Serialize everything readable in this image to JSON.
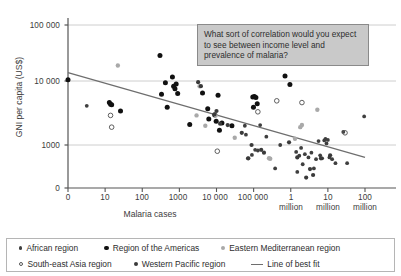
{
  "chart_data": {
    "type": "scatter",
    "title": "",
    "xlabel": "Malaria cases",
    "ylabel": "GNI per capita (US$)",
    "x_ticks": [
      "0",
      "10",
      "100",
      "1000",
      "10 000",
      "100 000",
      "1\nmillion",
      "10\nmillion",
      "100\nmillion"
    ],
    "x_tick_labels": [
      "0",
      "10",
      "100",
      "1000",
      "10 000",
      "100 000",
      "1",
      "10",
      "100"
    ],
    "x_tick_sublabels": [
      "",
      "",
      "",
      "",
      "",
      "",
      "million",
      "million",
      "million"
    ],
    "y_ticks": [
      "0",
      "1000",
      "10 000",
      "100 000"
    ],
    "x_scale": "log",
    "y_scale": "log",
    "grid": "horizontal",
    "legend_position": "below",
    "xlim": [
      0,
      100000000
    ],
    "ylim": [
      0,
      100000
    ],
    "series": [
      {
        "name": "African region",
        "marker": "small-filled-dark-dot",
        "color": "#3f3f3f",
        "points": [
          [
            3.2,
            4100
          ],
          [
            220000,
            1350
          ],
          [
            380000,
            430
          ],
          [
            520000,
            1000
          ],
          [
            1400000,
            780
          ],
          [
            1500000,
            380
          ],
          [
            1700000,
            680
          ],
          [
            1900000,
            900
          ],
          [
            2100000,
            500
          ],
          [
            2400000,
            720
          ],
          [
            3000000,
            640
          ],
          [
            3600000,
            760
          ],
          [
            4200000,
            430
          ],
          [
            4800000,
            600
          ],
          [
            5600000,
            1150
          ],
          [
            6200000,
            690
          ],
          [
            7000000,
            620
          ],
          [
            8000000,
            1180
          ],
          [
            8600000,
            1240
          ],
          [
            9200000,
            1060
          ],
          [
            10000000,
            1200
          ],
          [
            11000000,
            640
          ],
          [
            13000000,
            600
          ],
          [
            16000000,
            520
          ],
          [
            26000000,
            1600
          ],
          [
            33000000,
            520
          ],
          [
            95000000,
            2800
          ],
          [
            150000,
            2050
          ],
          [
            90000,
            700
          ],
          [
            110000,
            840
          ],
          [
            130000,
            820
          ],
          [
            62000,
            1450
          ],
          [
            70000,
            620
          ],
          [
            58000,
            2000
          ]
        ]
      },
      {
        "name": "Region of the Americas",
        "marker": "medium-filled-black-dot",
        "color": "#111111",
        "points": [
          [
            0.9,
            10500
          ],
          [
            13,
            4600
          ],
          [
            14,
            4350
          ],
          [
            15,
            4250
          ],
          [
            26,
            3400
          ],
          [
            300,
            25000
          ],
          [
            330,
            6200
          ],
          [
            420,
            9400
          ],
          [
            470,
            3900
          ],
          [
            650,
            11500
          ],
          [
            700,
            8300
          ],
          [
            760,
            7600
          ],
          [
            820,
            9000
          ],
          [
            900,
            6400
          ],
          [
            1900,
            2100
          ],
          [
            4200,
            6500
          ],
          [
            5800,
            3700
          ],
          [
            6200,
            2550
          ],
          [
            9000,
            2950
          ],
          [
            9800,
            2350
          ],
          [
            11000,
            6000
          ],
          [
            12000,
            1700
          ],
          [
            14000,
            2200
          ],
          [
            26000,
            2000
          ],
          [
            95000,
            5600
          ],
          [
            105000,
            5700
          ],
          [
            115000,
            5500
          ],
          [
            125000,
            4400
          ],
          [
            99000,
            3900
          ],
          [
            700000,
            12000
          ],
          [
            950000,
            8800
          ]
        ]
      },
      {
        "name": "Eastern Mediterranean region",
        "marker": "medium-grey-dot",
        "color": "#a9a9a9",
        "points": [
          [
            22,
            17500
          ],
          [
            3500,
            8300
          ],
          [
            5000,
            2000
          ],
          [
            2900,
            2900
          ],
          [
            9500,
            2900
          ],
          [
            260000,
            620
          ],
          [
            280000,
            610
          ],
          [
            1300000,
            1250
          ],
          [
            1800000,
            1900
          ],
          [
            2000000,
            2050
          ],
          [
            5200000,
            3550
          ],
          [
            31000,
            1300
          ]
        ]
      },
      {
        "name": "South-east Asia region",
        "marker": "open-circle",
        "color": "#555555",
        "points": [
          [
            14,
            2900
          ],
          [
            15,
            1900
          ],
          [
            10500,
            800
          ],
          [
            130000,
            3300
          ],
          [
            420000,
            4900
          ],
          [
            2000000,
            4600
          ],
          [
            29000000,
            1550
          ]
        ]
      },
      {
        "name": "Western Pacific region",
        "marker": "small-dark-dot",
        "color": "#3a3a3a",
        "points": [
          [
            3200,
            9600
          ],
          [
            3800,
            8300
          ],
          [
            8800,
            3000
          ],
          [
            10000,
            3400
          ],
          [
            12500,
            2150
          ],
          [
            20000,
            2050
          ],
          [
            48000,
            1550
          ],
          [
            72000,
            620
          ],
          [
            88000,
            1000
          ],
          [
            160000,
            840
          ],
          [
            190000,
            760
          ],
          [
            900000,
            1100
          ],
          [
            1500000,
            640
          ],
          [
            2600000,
            310
          ],
          [
            4000000,
            340
          ],
          [
            6500000,
            620
          ],
          [
            11500000,
            690
          ],
          [
            3300000,
            420
          ]
        ]
      }
    ],
    "line_of_best_fit": {
      "name": "Line of best fit",
      "color": "#6e6e6e",
      "start": [
        0,
        13500
      ],
      "end": [
        100000000,
        640
      ]
    }
  },
  "callout": {
    "text": "What sort of correlation would you expect to see between income level and prevalence of malaria?"
  },
  "legend": {
    "items": [
      {
        "label": "African region",
        "marker": "afr"
      },
      {
        "label": "Region of the Americas",
        "marker": "ame"
      },
      {
        "label": "Eastern Mediterranean region",
        "marker": "emr"
      },
      {
        "label": "South-east Asia region",
        "marker": "sea"
      },
      {
        "label": "Western Pacific region",
        "marker": "wpr"
      },
      {
        "label": "Line of best fit",
        "marker": "line"
      }
    ]
  },
  "colors": {
    "axis": "#555555",
    "grid": "#c8c8c8",
    "fit_line": "#6e6e6e",
    "callout_bg": "#c9c9c9",
    "callout_border": "#8a8a8a"
  }
}
